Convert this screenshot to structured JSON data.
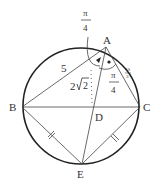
{
  "diagram": {
    "type": "geometry-circle-inscribed-quadrilateral",
    "points": {
      "A": {
        "label": "A",
        "x": 106,
        "y": 47
      },
      "B": {
        "label": "B",
        "x": 22,
        "y": 107
      },
      "C": {
        "label": "C",
        "x": 140,
        "y": 107
      },
      "D": {
        "label": "D",
        "x": 93,
        "y": 107
      },
      "E": {
        "label": "E",
        "x": 82,
        "y": 164
      }
    },
    "circle": {
      "cx": 81,
      "cy": 106,
      "r": 58
    },
    "labels": {
      "AB_length": "5",
      "AD_length_coef": "2",
      "AD_length_rad": "2",
      "AC_length_num": "10",
      "AC_length_den": "3",
      "angle_top_num": "π",
      "angle_top_den": "4",
      "angle_right_num": "π",
      "angle_right_den": "4"
    },
    "tick_marks": [
      "BE",
      "CE"
    ],
    "colors": {
      "stroke": "#333333",
      "circle": "#222222"
    }
  }
}
